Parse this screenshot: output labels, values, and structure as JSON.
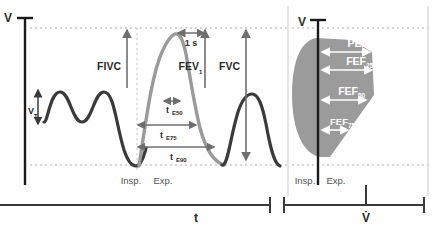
{
  "left_panel": {
    "name": "volume-time-panel",
    "y_axis_label": "V",
    "x_axis_label": "t",
    "tidal_volume_label": "V",
    "tidal_volume_sub": "T",
    "measures": [
      {
        "label": "FIVC",
        "sub": ""
      },
      {
        "label": "FEV",
        "sub": "1"
      },
      {
        "label": "FVC",
        "sub": ""
      }
    ],
    "time_marker": "1 s",
    "time_points": [
      {
        "label": "t",
        "sub": "E50"
      },
      {
        "label": "t",
        "sub": "E75"
      },
      {
        "label": "t",
        "sub": "E90"
      }
    ],
    "phases": [
      {
        "label": "Insp."
      },
      {
        "label": "Exp."
      }
    ]
  },
  "right_panel": {
    "name": "flow-volume-loop-panel",
    "y_axis_label": "V",
    "x_axis_label": "V̇",
    "measures": [
      {
        "label": "PEF",
        "sub": ""
      },
      {
        "label": "FEF",
        "sub": "25"
      },
      {
        "label": "FEF",
        "sub": "50"
      },
      {
        "label": "FEF",
        "sub": "75"
      }
    ],
    "phases": [
      {
        "label": "Insp."
      },
      {
        "label": "Exp."
      }
    ]
  },
  "colors": {
    "axis": "#1a1a1a",
    "tidal_curve": "#3a3a3a",
    "forced_curve": "#9a9a9a",
    "loop_fill": "#9b9b9b",
    "guide_dashed": "#b0b0b0",
    "arrow": "#6e6e6e",
    "arrow_white": "#ffffff",
    "frame": "#c9c9c9"
  }
}
